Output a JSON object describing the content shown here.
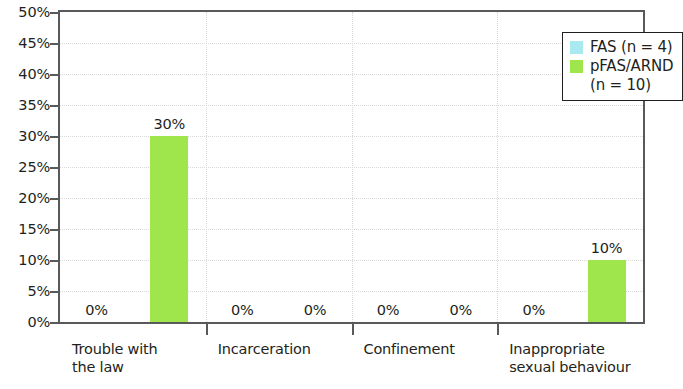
{
  "chart_data": {
    "type": "bar",
    "title": "",
    "subtitle": "",
    "xlabel": "",
    "ylabel": "",
    "ylim": [
      0,
      50
    ],
    "y_tick_step": 5,
    "y_tick_labels": [
      "0%",
      "5%",
      "10%",
      "15%",
      "20%",
      "25%",
      "30%",
      "35%",
      "40%",
      "45%",
      "50%"
    ],
    "grid": true,
    "grid_style": "dotted-horizontal",
    "legend_position": "top-right",
    "value_label_suffix": "%",
    "categories": [
      "Trouble with the law",
      "Incarceration",
      "Confinement",
      "Inappropriate sexual behaviour"
    ],
    "category_label_lines": [
      [
        "Trouble with",
        "the law"
      ],
      [
        "Incarceration"
      ],
      [
        "Confinement"
      ],
      [
        "Inappropriate",
        "sexual behaviour"
      ]
    ],
    "series": [
      {
        "name": "FAS (n = 4)",
        "color": "#A8EAF0",
        "values": [
          0,
          0,
          0,
          0
        ],
        "value_labels": [
          "0%",
          "0%",
          "0%",
          "0%"
        ]
      },
      {
        "name": "pFAS/ARND (n = 10)",
        "color": "#9FE64C",
        "values": [
          30,
          0,
          0,
          10
        ],
        "value_labels": [
          "30%",
          "0%",
          "0%",
          "10%"
        ]
      }
    ]
  },
  "legend": {
    "entries": [
      {
        "label": "FAS (n = 4)",
        "color": "#A8EAF0"
      },
      {
        "label": "pFAS/ARND",
        "label_line2": "(n = 10)",
        "color": "#9FE64C"
      }
    ]
  },
  "axis": {
    "y_labels": [
      "50%",
      "45%",
      "40%",
      "35%",
      "30%",
      "25%",
      "20%",
      "15%",
      "10%",
      "5%",
      "0%"
    ]
  }
}
